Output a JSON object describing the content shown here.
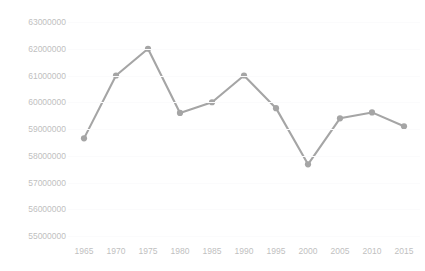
{
  "chart_data": {
    "type": "line",
    "title": "",
    "xlabel": "",
    "ylabel": "",
    "categories": [
      1965,
      1970,
      1975,
      1980,
      1985,
      1990,
      1995,
      2000,
      2005,
      2010,
      2015
    ],
    "category_labels": [
      "1965",
      "1970",
      "1975",
      "1980",
      "1985",
      "1990",
      "1995",
      "2000",
      "2005",
      "2010",
      "2015"
    ],
    "values": [
      58650000,
      61000000,
      62000000,
      59600000,
      60000000,
      61000000,
      59780000,
      57680000,
      59400000,
      59620000,
      59100000
    ],
    "series": [
      {
        "name": "",
        "values": [
          58650000,
          61000000,
          62000000,
          59600000,
          60000000,
          61000000,
          59780000,
          57680000,
          59400000,
          59620000,
          59100000
        ]
      }
    ],
    "ylim": [
      55000000,
      63000000
    ],
    "ytick_values": [
      63000000,
      62000000,
      61000000,
      60000000,
      59000000,
      58000000,
      57000000,
      56000000,
      55000000
    ],
    "ytick_labels": [
      "63000000",
      "62000000",
      "61000000",
      "60000000",
      "59000000",
      "58000000",
      "57000000",
      "56000000",
      "55000000"
    ],
    "grid": true,
    "legend": false,
    "legend_position": "none",
    "marker": "circle",
    "colors": {
      "series": "#a5a5a5",
      "gridline": "#fbfbfc",
      "tick_label": "#bfbfbf",
      "background": "#ffffff"
    }
  }
}
